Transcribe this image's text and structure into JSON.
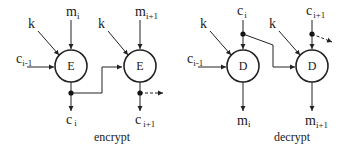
{
  "diagram": {
    "encrypt": {
      "caption": "encrypt",
      "blocks": [
        {
          "op": "E",
          "key": "k",
          "input_main": "m",
          "input_sub": "i",
          "output_main": "c",
          "output_sub": "i"
        },
        {
          "op": "E",
          "key": "k",
          "input_main": "m",
          "input_sub": "i+1",
          "output_main": "c",
          "output_sub": "i+1"
        }
      ],
      "chain_in": {
        "main": "c",
        "sub": "i-1"
      }
    },
    "decrypt": {
      "caption": "decrypt",
      "blocks": [
        {
          "op": "D",
          "key": "k",
          "input_main": "c",
          "input_sub": "i",
          "output_main": "m",
          "output_sub": "i"
        },
        {
          "op": "D",
          "key": "k",
          "input_main": "c",
          "input_sub": "i+1",
          "output_main": "m",
          "output_sub": "i+1"
        }
      ],
      "chain_in": {
        "main": "c",
        "sub": "i-1"
      }
    },
    "colors": {
      "stroke": "#222222",
      "background": "#ffffff"
    }
  }
}
